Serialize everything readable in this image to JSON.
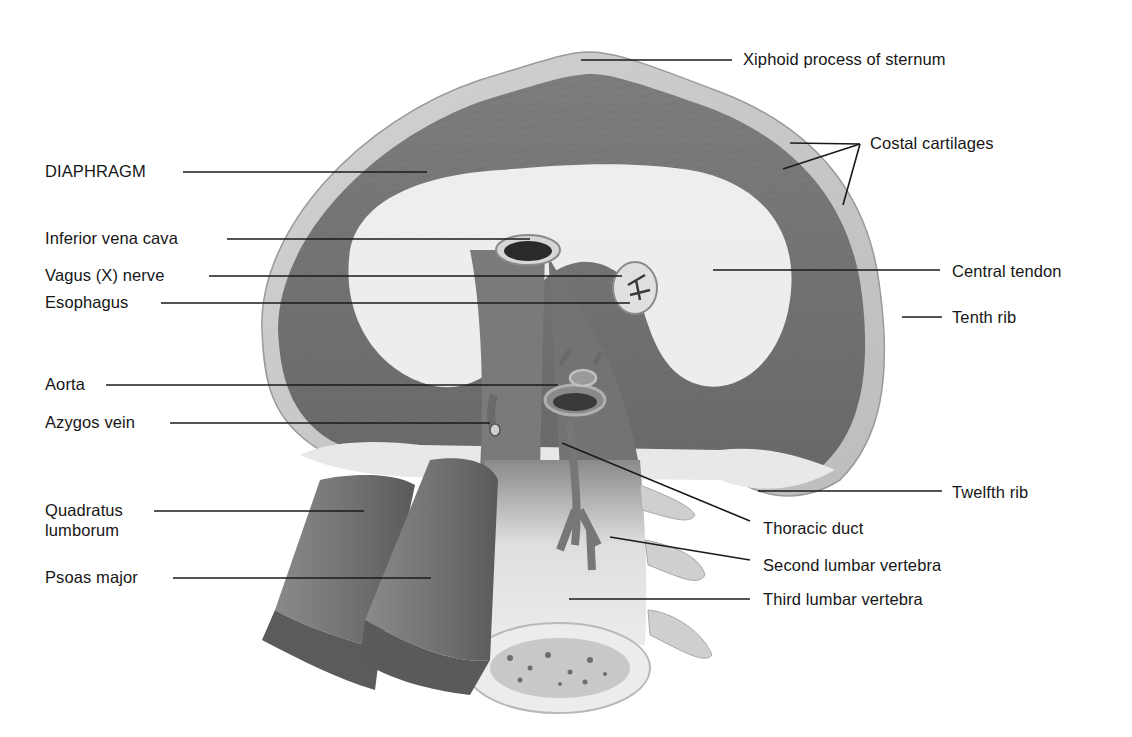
{
  "figure": {
    "labels_left": [
      {
        "id": "diaphragm",
        "text": "DIAPHRAGM"
      },
      {
        "id": "ivc",
        "text": "Inferior vena cava"
      },
      {
        "id": "vagus",
        "text": "Vagus (X) nerve"
      },
      {
        "id": "esophagus",
        "text": "Esophagus"
      },
      {
        "id": "aorta",
        "text": "Aorta"
      },
      {
        "id": "azygos",
        "text": "Azygos vein"
      },
      {
        "id": "quadratus1",
        "text": "Quadratus"
      },
      {
        "id": "quadratus2",
        "text": "lumborum"
      },
      {
        "id": "psoas",
        "text": "Psoas major"
      }
    ],
    "labels_right": [
      {
        "id": "xiphoid",
        "text": "Xiphoid process of sternum"
      },
      {
        "id": "costal",
        "text": "Costal cartilages"
      },
      {
        "id": "central",
        "text": "Central tendon"
      },
      {
        "id": "tenth",
        "text": "Tenth rib"
      },
      {
        "id": "twelfth",
        "text": "Twelfth rib"
      },
      {
        "id": "thoracic",
        "text": "Thoracic duct"
      },
      {
        "id": "second",
        "text": "Second lumbar vertebra"
      },
      {
        "id": "third",
        "text": "Third lumbar vertebra"
      }
    ]
  },
  "colors": {
    "muscle_dark": "#6e6e6e",
    "muscle_mid": "#8f8f8f",
    "tendon": "#f2f2f2",
    "rim": "#c9c9c9",
    "bone": "#e6e6e6",
    "line": "#1a1a1a",
    "text": "#161616"
  }
}
